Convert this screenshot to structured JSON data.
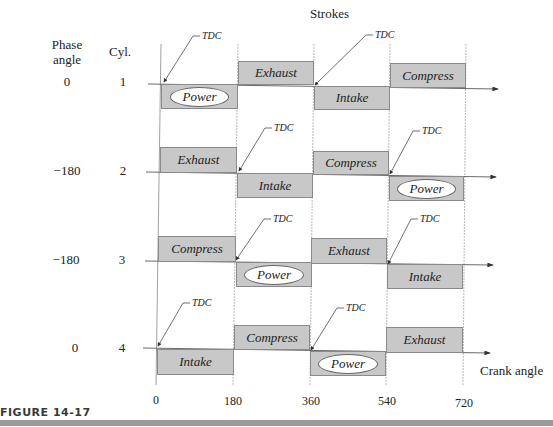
{
  "title": "Strokes",
  "headers": {
    "phase": "Phase\nangle",
    "phase_line1": "Phase",
    "phase_line2": "angle",
    "cyl": "Cyl."
  },
  "cylinders": [
    {
      "cyl": "1",
      "phase": "0",
      "strokes": [
        {
          "label": "Power",
          "pos": "below",
          "start": 0,
          "end": 180,
          "ellipse": true
        },
        {
          "label": "Exhaust",
          "pos": "above",
          "start": 180,
          "end": 360,
          "ellipse": false
        },
        {
          "label": "Intake",
          "pos": "below",
          "start": 360,
          "end": 540,
          "ellipse": false
        },
        {
          "label": "Compress",
          "pos": "above",
          "start": 540,
          "end": 720,
          "ellipse": false
        }
      ],
      "tdc": [
        0,
        360
      ]
    },
    {
      "cyl": "2",
      "phase": "−180",
      "strokes": [
        {
          "label": "Exhaust",
          "pos": "above",
          "start": 0,
          "end": 180,
          "ellipse": false
        },
        {
          "label": "Intake",
          "pos": "below",
          "start": 180,
          "end": 360,
          "ellipse": false
        },
        {
          "label": "Compress",
          "pos": "above",
          "start": 360,
          "end": 540,
          "ellipse": false
        },
        {
          "label": "Power",
          "pos": "below",
          "start": 540,
          "end": 720,
          "ellipse": true
        }
      ],
      "tdc": [
        180,
        540
      ]
    },
    {
      "cyl": "3",
      "phase": "−180",
      "strokes": [
        {
          "label": "Compress",
          "pos": "above",
          "start": 0,
          "end": 180,
          "ellipse": false
        },
        {
          "label": "Power",
          "pos": "below",
          "start": 180,
          "end": 360,
          "ellipse": true
        },
        {
          "label": "Exhaust",
          "pos": "above",
          "start": 360,
          "end": 540,
          "ellipse": false
        },
        {
          "label": "Intake",
          "pos": "below",
          "start": 540,
          "end": 720,
          "ellipse": false
        }
      ],
      "tdc": [
        180,
        540
      ]
    },
    {
      "cyl": "4",
      "phase": "0",
      "strokes": [
        {
          "label": "Intake",
          "pos": "below",
          "start": 0,
          "end": 180,
          "ellipse": false
        },
        {
          "label": "Compress",
          "pos": "above",
          "start": 180,
          "end": 360,
          "ellipse": false
        },
        {
          "label": "Power",
          "pos": "below",
          "start": 360,
          "end": 540,
          "ellipse": true
        },
        {
          "label": "Exhaust",
          "pos": "above",
          "start": 540,
          "end": 720,
          "ellipse": false
        }
      ],
      "tdc": [
        0,
        360
      ]
    }
  ],
  "tdc_label": "TDC",
  "x_axis": {
    "label": "Crank  angle",
    "ticks": [
      "0",
      "180",
      "360",
      "540",
      "720"
    ]
  },
  "caption": "FIGURE 14-17",
  "colors": {
    "box_fill": "#c8c8c8",
    "box_border": "#8a8a8a",
    "line": "#444444",
    "caption_bar": "#9a9a9a"
  }
}
